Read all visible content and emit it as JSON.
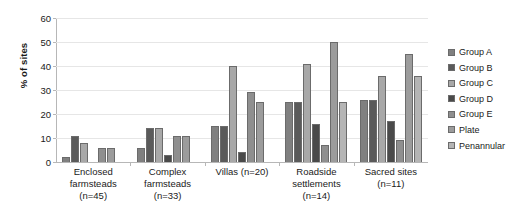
{
  "chart_data": {
    "type": "bar",
    "title": "",
    "xlabel": "",
    "ylabel": "% of sites",
    "ylim": [
      0,
      60
    ],
    "yticks": [
      0,
      10,
      20,
      30,
      40,
      50,
      60
    ],
    "grid": true,
    "legend_position": "right",
    "categories": [
      "Enclosed farmsteads (n=45)",
      "Complex farmsteads (n=33)",
      "Villas (n=20)",
      "Roadside settlements (n=14)",
      "Sacred sites (n=11)"
    ],
    "category_lines": [
      [
        "Enclosed",
        "farmsteads",
        "(n=45)"
      ],
      [
        "Complex",
        "farmsteads",
        "(n=33)"
      ],
      [
        "Villas (n=20)"
      ],
      [
        "Roadside",
        "settlements",
        "(n=14)"
      ],
      [
        "Sacred sites",
        "(n=11)"
      ]
    ],
    "series": [
      {
        "name": "Group A",
        "color": "#808080",
        "values": [
          2,
          6,
          15,
          25,
          26
        ]
      },
      {
        "name": "Group B",
        "color": "#5a5a5a",
        "values": [
          11,
          14,
          15,
          25,
          26
        ]
      },
      {
        "name": "Group C",
        "color": "#a8a8a8",
        "values": [
          8,
          14,
          40,
          41,
          36
        ]
      },
      {
        "name": "Group D",
        "color": "#4a4a4a",
        "values": [
          0,
          3,
          4,
          16,
          17
        ]
      },
      {
        "name": "Group E",
        "color": "#8f8f8f",
        "values": [
          6,
          11,
          29,
          7,
          9
        ]
      },
      {
        "name": "Plate",
        "color": "#9c9c9c",
        "values": [
          6,
          11,
          25,
          50,
          45
        ]
      },
      {
        "name": "Penannular",
        "color": "#b5b5b5",
        "values": [
          0,
          0,
          0,
          25,
          36
        ]
      }
    ]
  }
}
